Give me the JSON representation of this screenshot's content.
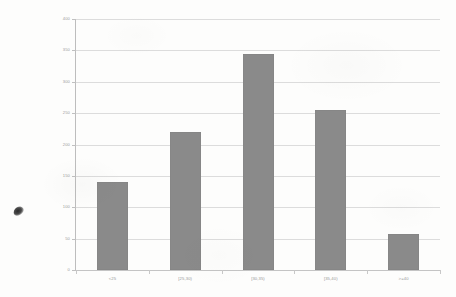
{
  "chart_data": {
    "type": "bar",
    "title": "",
    "subtitle": "",
    "xlabel": "",
    "ylabel": "",
    "categories": [
      "<25",
      "[25,30)",
      "[30,35)",
      "[35,40)",
      ">=40"
    ],
    "values": [
      140,
      220,
      345,
      255,
      57
    ],
    "series": [
      {
        "name": "count",
        "values": [
          140,
          220,
          345,
          255,
          57
        ]
      }
    ],
    "ylim": [
      0,
      400
    ],
    "y_ticks": [
      0,
      50,
      100,
      150,
      200,
      250,
      300,
      350,
      400
    ],
    "y_tick_labels": [
      "0",
      "50",
      "100",
      "150",
      "200",
      "250",
      "300",
      "350",
      "400"
    ],
    "grid": true,
    "grid_axis": "y",
    "legend": false,
    "legend_position": "none",
    "annotations": []
  },
  "style": {
    "bar_color": "#8a8a8a",
    "gridline_color": "#dcdcdc",
    "axis_color": "#bdbdbd",
    "tick_label_color": "#8c8c8c",
    "background_color": "#fdfdfc"
  },
  "artifacts": {
    "ink_blot_name": "scan-ink-blot"
  }
}
